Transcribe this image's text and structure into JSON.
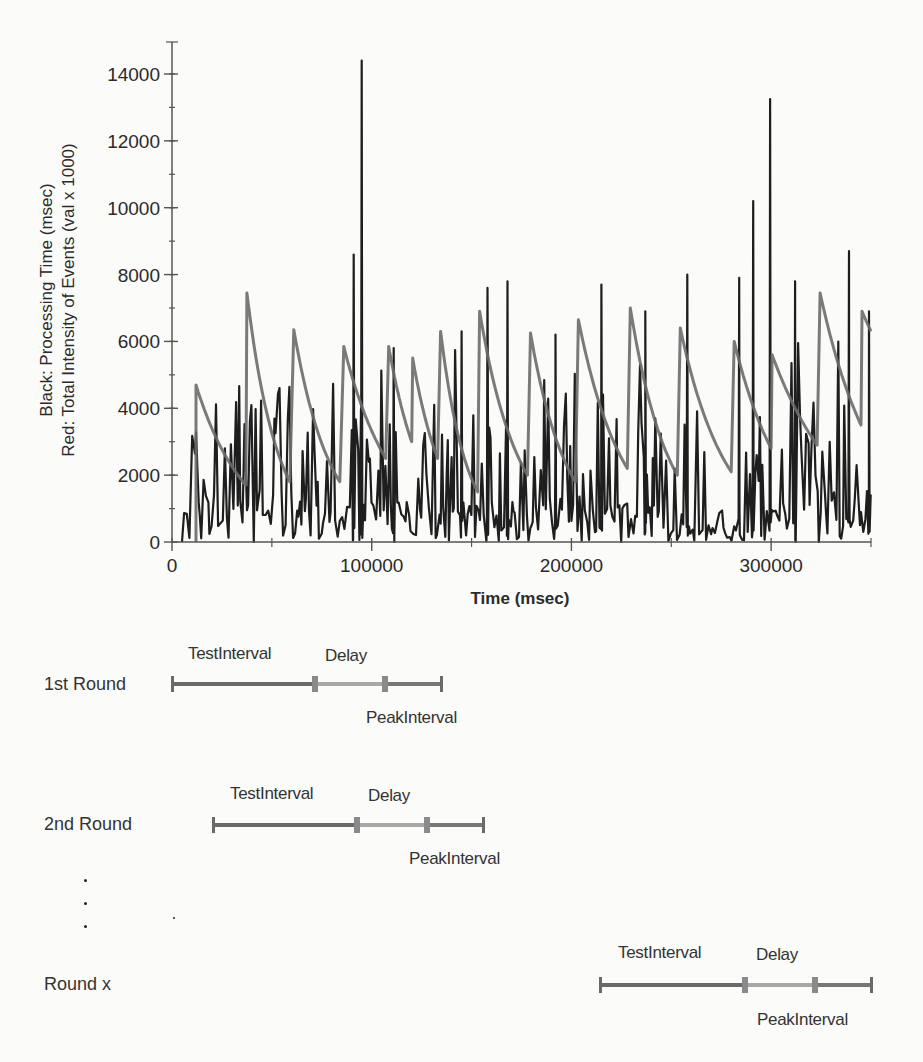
{
  "chart_data": {
    "type": "line",
    "title": "",
    "xlabel": "Time (msec)",
    "ylabel_lines": [
      "Black: Processing Time (msec)",
      "Red: Total Intensity of Events (val x 1000)"
    ],
    "xlim": [
      0,
      350000
    ],
    "ylim": [
      0,
      14800
    ],
    "x_ticks": [
      0,
      100000,
      200000,
      300000
    ],
    "x_tick_labels": [
      "0",
      "100000",
      "200000",
      "300000"
    ],
    "x_minor_ticks": [
      50000,
      150000,
      250000,
      350000
    ],
    "y_ticks": [
      0,
      2000,
      4000,
      6000,
      8000,
      10000,
      12000,
      14000
    ],
    "y_tick_labels": [
      "0",
      "2000",
      "4000",
      "6000",
      "8000",
      "10000",
      "12000",
      "14000"
    ],
    "y_minor_step": 1000,
    "grid": false,
    "legend": "none (series identified in y-axis label)",
    "series": [
      {
        "name": "Total Intensity of Events (val x 1000)",
        "color": "#6b6b6b",
        "description": "sawtooth: sharp rise to peak then exponential decay",
        "segments": [
          {
            "start_x": 12000,
            "peak": 4700,
            "end_x": 37000,
            "end": 1700
          },
          {
            "start_x": 37500,
            "peak": 7450,
            "end_x": 59000,
            "end": 1800
          },
          {
            "start_x": 61000,
            "peak": 6350,
            "end_x": 84000,
            "end": 1800
          },
          {
            "start_x": 86000,
            "peak": 5850,
            "end_x": 107000,
            "end": 2500
          },
          {
            "start_x": 108500,
            "peak": 5850,
            "end_x": 120000,
            "end": 3000
          },
          {
            "start_x": 120500,
            "peak": 5500,
            "end_x": 133000,
            "end": 2500
          },
          {
            "start_x": 134500,
            "peak": 6300,
            "end_x": 153000,
            "end": 1500
          },
          {
            "start_x": 154000,
            "peak": 6900,
            "end_x": 178000,
            "end": 2000
          },
          {
            "start_x": 179500,
            "peak": 6250,
            "end_x": 202000,
            "end": 1800
          },
          {
            "start_x": 203500,
            "peak": 6650,
            "end_x": 228000,
            "end": 2200
          },
          {
            "start_x": 229500,
            "peak": 7000,
            "end_x": 253000,
            "end": 2000
          },
          {
            "start_x": 254500,
            "peak": 6400,
            "end_x": 280000,
            "end": 2100
          },
          {
            "start_x": 281500,
            "peak": 6000,
            "end_x": 300000,
            "end": 2800
          },
          {
            "start_x": 300500,
            "peak": 5600,
            "end_x": 323000,
            "end": 2900
          },
          {
            "start_x": 324500,
            "peak": 7450,
            "end_x": 345000,
            "end": 3500
          },
          {
            "start_x": 345500,
            "peak": 6900,
            "end_x": 350000,
            "end": 6300
          }
        ]
      },
      {
        "name": "Processing Time (msec)",
        "color": "#1e1e1e",
        "description": "noisy spiky series, baseline ~0-2000 with frequent spikes",
        "notable_spikes": [
          {
            "x": 91000,
            "y": 8600
          },
          {
            "x": 95000,
            "y": 14400
          },
          {
            "x": 111000,
            "y": 5800
          },
          {
            "x": 145000,
            "y": 6300
          },
          {
            "x": 158000,
            "y": 7600
          },
          {
            "x": 168000,
            "y": 7800
          },
          {
            "x": 192000,
            "y": 6200
          },
          {
            "x": 215000,
            "y": 7700
          },
          {
            "x": 237000,
            "y": 6900
          },
          {
            "x": 258000,
            "y": 8000
          },
          {
            "x": 284000,
            "y": 7900
          },
          {
            "x": 291000,
            "y": 10200
          },
          {
            "x": 299500,
            "y": 13250
          },
          {
            "x": 312000,
            "y": 7800
          },
          {
            "x": 339000,
            "y": 8700
          },
          {
            "x": 349000,
            "y": 6900
          }
        ]
      }
    ]
  },
  "diagram": {
    "rounds": [
      {
        "label": "1st Round",
        "test_label": "TestInterval",
        "delay_label": "Delay",
        "peak_label": "PeakInterval",
        "start_px": 171,
        "test_end_px": 315,
        "delay_end_px": 385,
        "end_px": 440,
        "y_px": 684
      },
      {
        "label": "2nd Round",
        "test_label": "TestInterval",
        "delay_label": "Delay",
        "peak_label": "PeakInterval",
        "start_px": 212,
        "test_end_px": 357,
        "delay_end_px": 427,
        "end_px": 482,
        "y_px": 825
      },
      {
        "label": "Round x",
        "test_label": "TestInterval",
        "delay_label": "Delay",
        "peak_label": "PeakInterval",
        "start_px": 599,
        "test_end_px": 745,
        "delay_end_px": 815,
        "end_px": 870,
        "y_px": 985
      }
    ],
    "ellipsis": "⋮"
  }
}
